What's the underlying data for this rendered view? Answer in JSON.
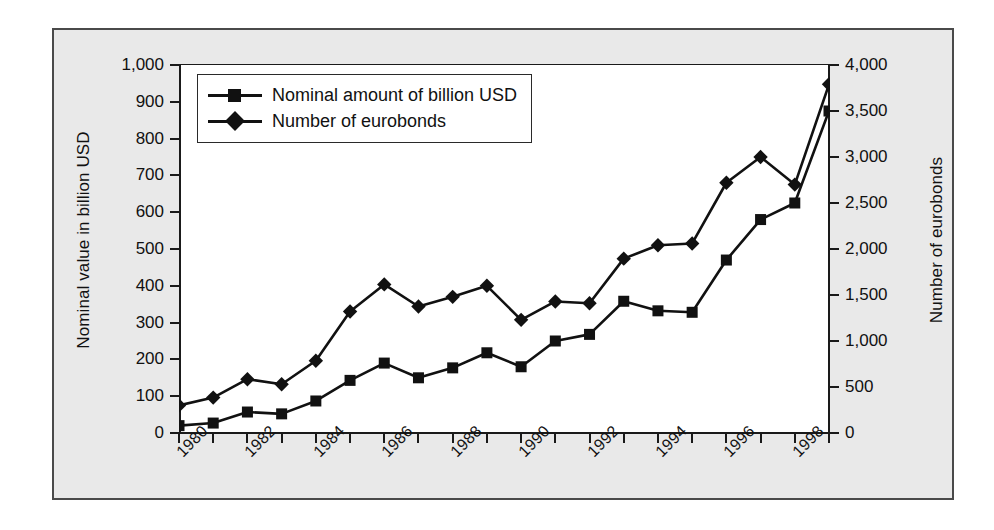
{
  "figure": {
    "background_color": "#e9e9e9",
    "plot_background_color": "#ffffff",
    "series_color": "#111111",
    "border_color": "#4a4a4a"
  },
  "legend": {
    "items": [
      {
        "label": "Nominal amount of billion USD",
        "marker": "square-marker"
      },
      {
        "label": "Number of eurobonds",
        "marker": "diamond-marker"
      }
    ]
  },
  "chart_data": {
    "type": "line",
    "title": "",
    "xlabel": "",
    "ylabel": "Nominal value in billion USD",
    "y2label": "Number of eurobonds",
    "grid": false,
    "legend_position": "top-left",
    "x": [
      1980,
      1981,
      1982,
      1983,
      1984,
      1985,
      1986,
      1987,
      1988,
      1989,
      1990,
      1991,
      1992,
      1993,
      1994,
      1995,
      1996,
      1997,
      1998,
      1999
    ],
    "xtick_labels": [
      "1980",
      "1982",
      "1984",
      "1986",
      "1988",
      "1990",
      "1992",
      "1994",
      "1996",
      "1998"
    ],
    "xtick_values": [
      1980,
      1982,
      1984,
      1986,
      1988,
      1990,
      1992,
      1994,
      1996,
      1998
    ],
    "xlim": [
      1980,
      1999
    ],
    "ylim": [
      0,
      1000
    ],
    "ytick_labels": [
      "0",
      "100",
      "200",
      "300",
      "400",
      "500",
      "600",
      "700",
      "800",
      "900",
      "1,000"
    ],
    "ytick_values": [
      0,
      100,
      200,
      300,
      400,
      500,
      600,
      700,
      800,
      900,
      1000
    ],
    "y2lim": [
      0,
      4000
    ],
    "y2tick_labels": [
      "0",
      "500",
      "1,000",
      "1,500",
      "2,000",
      "2,500",
      "3,000",
      "3,500",
      "4,000"
    ],
    "y2tick_values": [
      0,
      500,
      1000,
      1500,
      2000,
      2500,
      3000,
      3500,
      4000
    ],
    "series": [
      {
        "name": "Nominal amount of billion USD",
        "axis": "left",
        "marker": "square",
        "values": [
          20,
          27,
          57,
          52,
          87,
          143,
          190,
          150,
          177,
          218,
          180,
          250,
          268,
          358,
          332,
          328,
          470,
          580,
          625,
          875
        ]
      },
      {
        "name": "Number of eurobonds",
        "axis": "right",
        "marker": "diamond",
        "values": [
          300,
          385,
          585,
          530,
          785,
          1320,
          1615,
          1375,
          1480,
          1600,
          1230,
          1430,
          1410,
          1895,
          2040,
          2060,
          2720,
          3000,
          2700,
          3790
        ]
      }
    ]
  }
}
